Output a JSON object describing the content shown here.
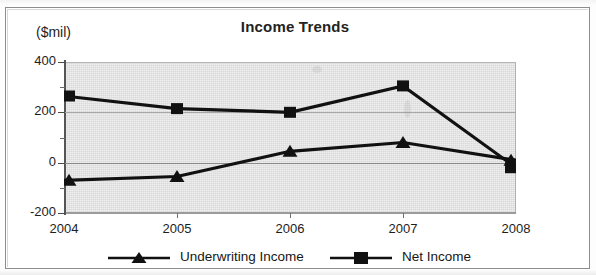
{
  "chart_data": {
    "type": "line",
    "title": "Income Trends",
    "xlabel": "",
    "ylabel": "($mil)",
    "y_unit_label": "($mil)",
    "categories": [
      "2004",
      "2005",
      "2006",
      "2007",
      "2008"
    ],
    "x": [
      2004,
      2005,
      2006,
      2007,
      2008
    ],
    "ylim": [
      -200,
      400
    ],
    "yticks": [
      400,
      200,
      0,
      -200
    ],
    "ytick_labels": [
      "400",
      "200",
      "0",
      "-200"
    ],
    "yminor_ticks": [
      300,
      100,
      -100
    ],
    "grid": true,
    "grid_axis": "y",
    "legend_position": "bottom",
    "series": [
      {
        "name": "Underwriting Income",
        "marker": "triangle",
        "color": "#111111",
        "values": [
          -70,
          -55,
          45,
          80,
          10
        ]
      },
      {
        "name": "Net Income",
        "marker": "square",
        "color": "#111111",
        "values": [
          265,
          215,
          200,
          305,
          -20
        ]
      }
    ]
  },
  "legend": {
    "items": [
      {
        "label": "Underwriting Income",
        "marker": "triangle-marker"
      },
      {
        "label": "Net Income",
        "marker": "square-marker"
      }
    ]
  },
  "colors": {
    "plot_background": "#d9d9d9",
    "series_line": "#111111",
    "gridline": "#a8a8a8",
    "axis": "#555555",
    "text": "#1d1d1d",
    "page_background": "#ffffff"
  }
}
